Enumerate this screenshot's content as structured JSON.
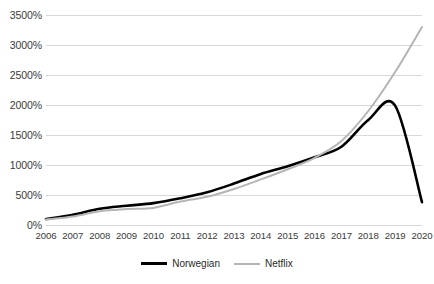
{
  "chart_data": {
    "type": "line",
    "title": "",
    "subtitle": "",
    "xlabel": "",
    "ylabel": "",
    "x": [
      2006,
      2007,
      2008,
      2009,
      2010,
      2011,
      2012,
      2013,
      2014,
      2015,
      2016,
      2017,
      2018,
      2019,
      2020
    ],
    "categories": [
      "2006",
      "2007",
      "2008",
      "2009",
      "2010",
      "2011",
      "2012",
      "2013",
      "2014",
      "2015",
      "2016",
      "2017",
      "2018",
      "2019",
      "2020"
    ],
    "series": [
      {
        "name": "Norwegian",
        "color": "#000000",
        "width": 2.6,
        "values": [
          100,
          170,
          270,
          320,
          365,
          445,
          545,
          690,
          850,
          980,
          1130,
          1305,
          1750,
          1990,
          380
        ]
      },
      {
        "name": "Netflix",
        "color": "#b5b5b5",
        "width": 2.0,
        "values": [
          90,
          140,
          230,
          265,
          285,
          390,
          470,
          600,
          760,
          930,
          1120,
          1400,
          1900,
          2550,
          3300
        ]
      }
    ],
    "ylim": [
      0,
      3500
    ],
    "yticks": [
      0,
      500,
      1000,
      1500,
      2000,
      2500,
      3000,
      3500
    ],
    "ytick_labels": [
      "0%",
      "500%",
      "1000%",
      "1500%",
      "2000%",
      "2500%",
      "3000%",
      "3500%"
    ],
    "xtick_labels": [
      "2006",
      "2007",
      "2008",
      "2009",
      "2010",
      "2011",
      "2012",
      "2013",
      "2014",
      "2015",
      "2016",
      "2017",
      "2018",
      "2019",
      "2020"
    ],
    "grid": true,
    "grid_axis": "y",
    "grid_color": "#d9d9d9",
    "legend": {
      "position": "bottom",
      "entries": [
        {
          "label": "Norwegian",
          "color": "#000000",
          "style": "thick"
        },
        {
          "label": "Netflix",
          "color": "#b5b5b5",
          "style": "thin"
        }
      ]
    },
    "annotations": []
  },
  "legend": {
    "norwegian_label": "Norwegian",
    "netflix_label": "Netflix"
  }
}
